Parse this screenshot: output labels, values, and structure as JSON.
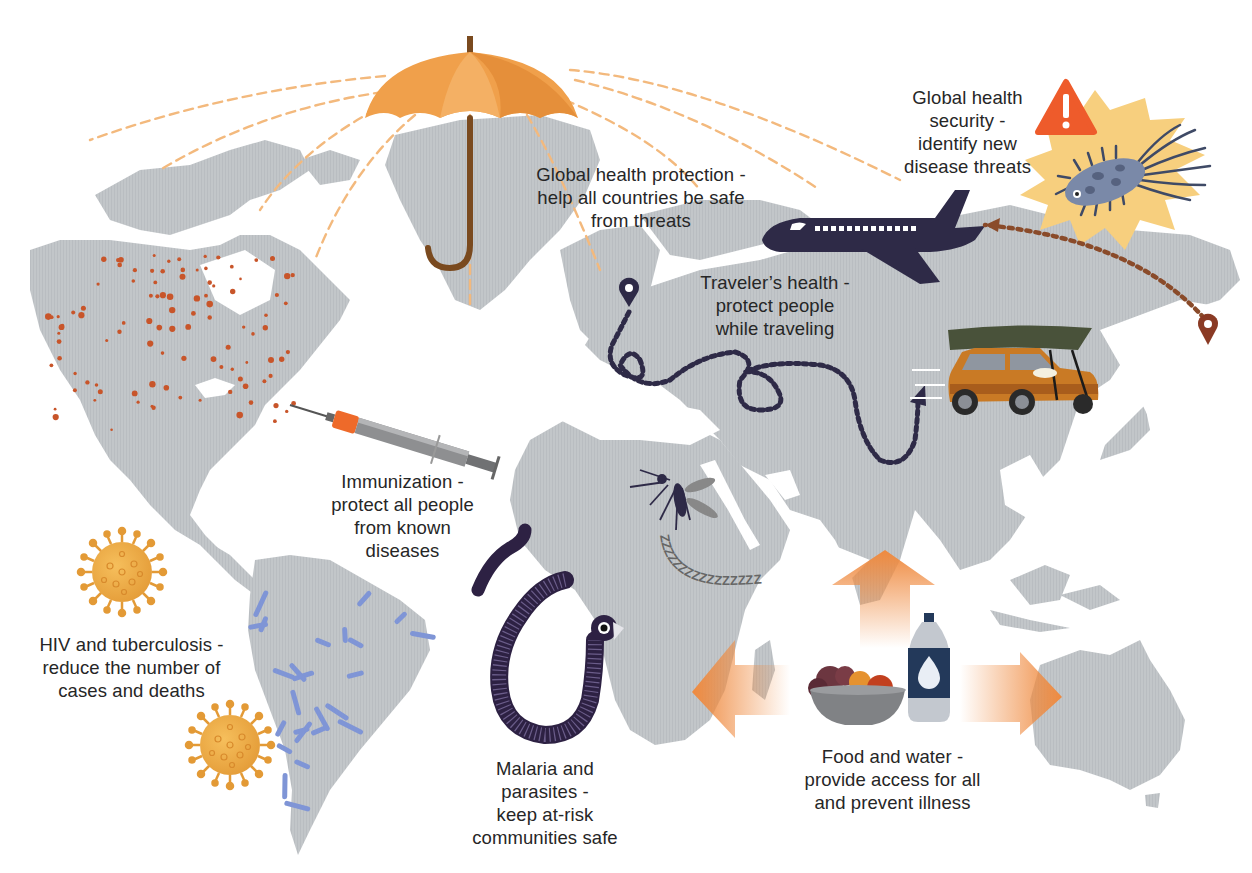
{
  "colors": {
    "land": "#c2c6c9",
    "background": "#ffffff",
    "umbrella": "#f0a04b",
    "umbrella_dark": "#e18d3a",
    "umbrella_handle": "#7a4a1f",
    "dash_lines": "#f3b97d",
    "accent_red": "#c8552a",
    "navy": "#2e2a47",
    "alert_red": "#ee5b2b",
    "starburst": "#f7cf7e",
    "arrow_orange": "#ef8a3f",
    "virus_orange": "#e9a13e",
    "bacteria_blue": "#7f95d6",
    "car_orange": "#c97a25",
    "canoe_green": "#49523a",
    "worm_purple": "#2d2143",
    "bottle_navy": "#23395a"
  },
  "labels": {
    "global_health_protection": {
      "lines": [
        "Global health protection -",
        "help all countries be safe",
        "from threats"
      ],
      "icon": "umbrella-icon"
    },
    "global_health_security": {
      "lines": [
        "Global health",
        "security -",
        "identify new",
        "disease threats"
      ],
      "icon": "warning-icon"
    },
    "travelers_health": {
      "lines": [
        "Traveler’s health -",
        "protect people",
        "while traveling"
      ],
      "icon": "airplane-icon"
    },
    "immunization": {
      "lines": [
        "Immunization -",
        "protect all people",
        "from known",
        "diseases"
      ],
      "icon": "syringe-icon"
    },
    "hiv_tuberculosis": {
      "lines": [
        "HIV and tuberculosis -",
        "reduce the number of",
        "cases and deaths"
      ],
      "icon": "virus-icon"
    },
    "malaria_parasites": {
      "lines": [
        "Malaria and",
        "parasites -",
        "keep at-risk",
        "communities safe"
      ],
      "icon": "mosquito-icon"
    },
    "food_water": {
      "lines": [
        "Food and water -",
        "provide access for all",
        "and prevent illness"
      ],
      "icon": "water-bottle-icon"
    }
  },
  "illustrations": [
    "umbrella-icon",
    "warning-icon",
    "bacterium-icon",
    "airplane-icon",
    "location-pin-icon",
    "car-with-canoe-icon",
    "syringe-icon",
    "virus-icon",
    "bacteria-rods-icon",
    "mosquito-icon",
    "worm-icon",
    "fruit-bowl-icon",
    "water-bottle-icon",
    "arrow-icon"
  ],
  "mosquito_snore": "ZZZZZZZZZZZZZZZZ"
}
